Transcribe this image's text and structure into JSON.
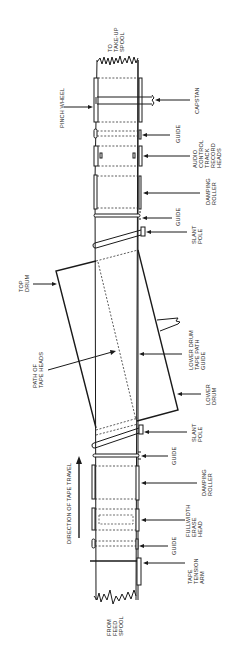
{
  "diagram": {
    "orientation": "rotated 90 degrees counter-clockwise",
    "stroke_color": "#1a1a1a",
    "background": "#ffffff",
    "labels": {
      "to_takeup_spool": [
        "TO",
        "TAKE-UP",
        "SPOOL"
      ],
      "pinch_wheel": [
        "PINCH WHEEL"
      ],
      "capstan": [
        "CAPSTAN"
      ],
      "guide_top": [
        "GUIDE"
      ],
      "audio_control": [
        "AUDIO",
        "CONTROL",
        "TRACK",
        "RECORD",
        "HEADS"
      ],
      "damping_roller_top": [
        "DAMPING",
        "ROLLER"
      ],
      "guide_upper": [
        "GUIDE"
      ],
      "slant_pole_upper": [
        "SLANT",
        "POLE"
      ],
      "top_drum": [
        "TOP",
        "DRUM"
      ],
      "path_of_tape_heads": [
        "PATH OF",
        "TAPE HEADS"
      ],
      "lower_drum_tape_path_guide": [
        "LOWER DRUM",
        "TAPE PATH",
        "GUIDE"
      ],
      "lower_drum": [
        "LOWER",
        "DRUM"
      ],
      "slant_pole_lower": [
        "SLANT",
        "POLE"
      ],
      "direction_of_tape_travel": [
        "DIRECTION OF TAPE TRAVEL"
      ],
      "guide_lower": [
        "GUIDE"
      ],
      "damping_roller_bottom": [
        "DAMPING",
        "ROLLER"
      ],
      "fullwidth_erase_head": [
        "FULLWIDTH",
        "ERASE",
        "HEAD"
      ],
      "guide_bottom": [
        "GUIDE"
      ],
      "tape_tension_arm": [
        "TAPE",
        "TENSION",
        "ARM"
      ],
      "from_feed_spool": [
        "FROM",
        "FEED",
        "SPOOL"
      ]
    }
  }
}
